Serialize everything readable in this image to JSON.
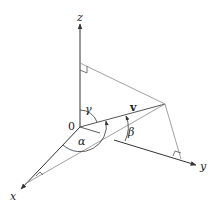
{
  "diagram": {
    "labels": {
      "x_axis": "x",
      "y_axis": "y",
      "z_axis": "z",
      "origin": "0",
      "vector": "v",
      "alpha": "α",
      "beta": "β",
      "gamma": "γ"
    },
    "colors": {
      "axis": "#333333",
      "projection": "#888888",
      "vector": "#555555"
    }
  }
}
